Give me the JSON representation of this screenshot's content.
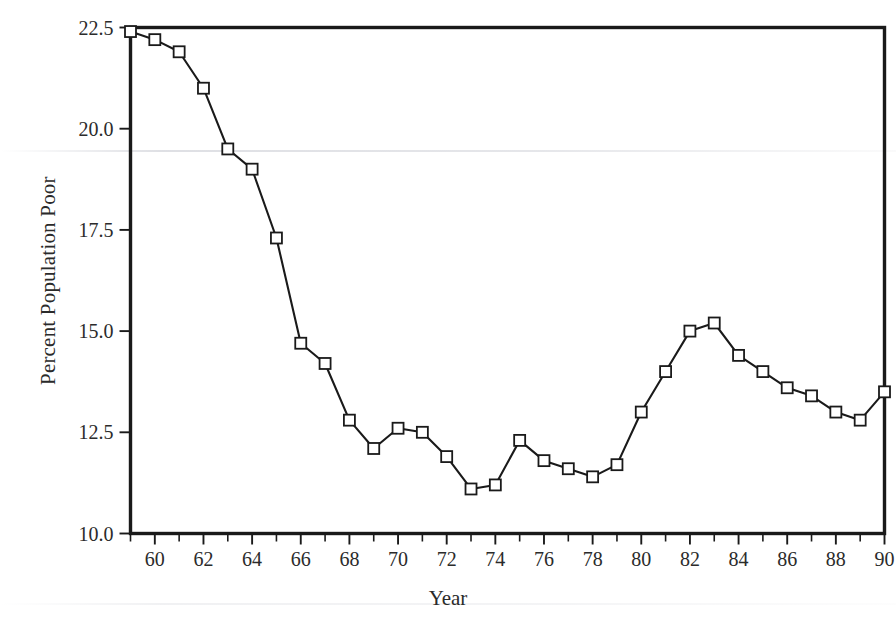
{
  "figure": {
    "axis_title_x": "Year",
    "axis_title_y": "Percent Population Poor",
    "frame_color": "#1a1a1a",
    "line_color": "#1a1a1a",
    "marker_color": "#1a1a1a",
    "marker_fill": "#ffffff",
    "background": "#ffffff"
  },
  "chart_data": {
    "type": "line",
    "title": "",
    "xlabel": "Year",
    "ylabel": "Percent Population Poor",
    "xlim": [
      59,
      90
    ],
    "ylim": [
      10.0,
      22.5
    ],
    "grid": false,
    "legend": null,
    "marker": "open-square",
    "x_tick_labels": [
      "60",
      "62",
      "64",
      "66",
      "68",
      "70",
      "72",
      "74",
      "76",
      "78",
      "80",
      "82",
      "84",
      "86",
      "88",
      "90"
    ],
    "x_tick_values": [
      60,
      62,
      64,
      66,
      68,
      70,
      72,
      74,
      76,
      78,
      80,
      82,
      84,
      86,
      88,
      90
    ],
    "x_minor_tick_values": [
      59,
      61,
      63,
      65,
      67,
      69,
      71,
      73,
      75,
      77,
      79,
      81,
      83,
      85,
      87,
      89
    ],
    "y_tick_labels": [
      "22.5",
      "20.0",
      "17.5",
      "15.0",
      "12.5",
      "10.0"
    ],
    "y_tick_values": [
      22.5,
      20.0,
      17.5,
      15.0,
      12.5,
      10.0
    ],
    "x": [
      59,
      60,
      61,
      62,
      63,
      64,
      65,
      66,
      67,
      68,
      69,
      70,
      71,
      72,
      73,
      74,
      75,
      76,
      77,
      78,
      79,
      80,
      81,
      82,
      83,
      84,
      85,
      86,
      87,
      88,
      89,
      90
    ],
    "values": [
      22.4,
      22.2,
      21.9,
      21.0,
      19.5,
      19.0,
      17.3,
      14.7,
      14.2,
      12.8,
      12.1,
      12.6,
      12.5,
      11.9,
      11.1,
      11.2,
      12.3,
      11.8,
      11.6,
      11.4,
      11.7,
      13.0,
      14.0,
      15.0,
      15.2,
      14.4,
      14.0,
      13.6,
      13.4,
      13.0,
      12.8,
      13.5
    ]
  }
}
